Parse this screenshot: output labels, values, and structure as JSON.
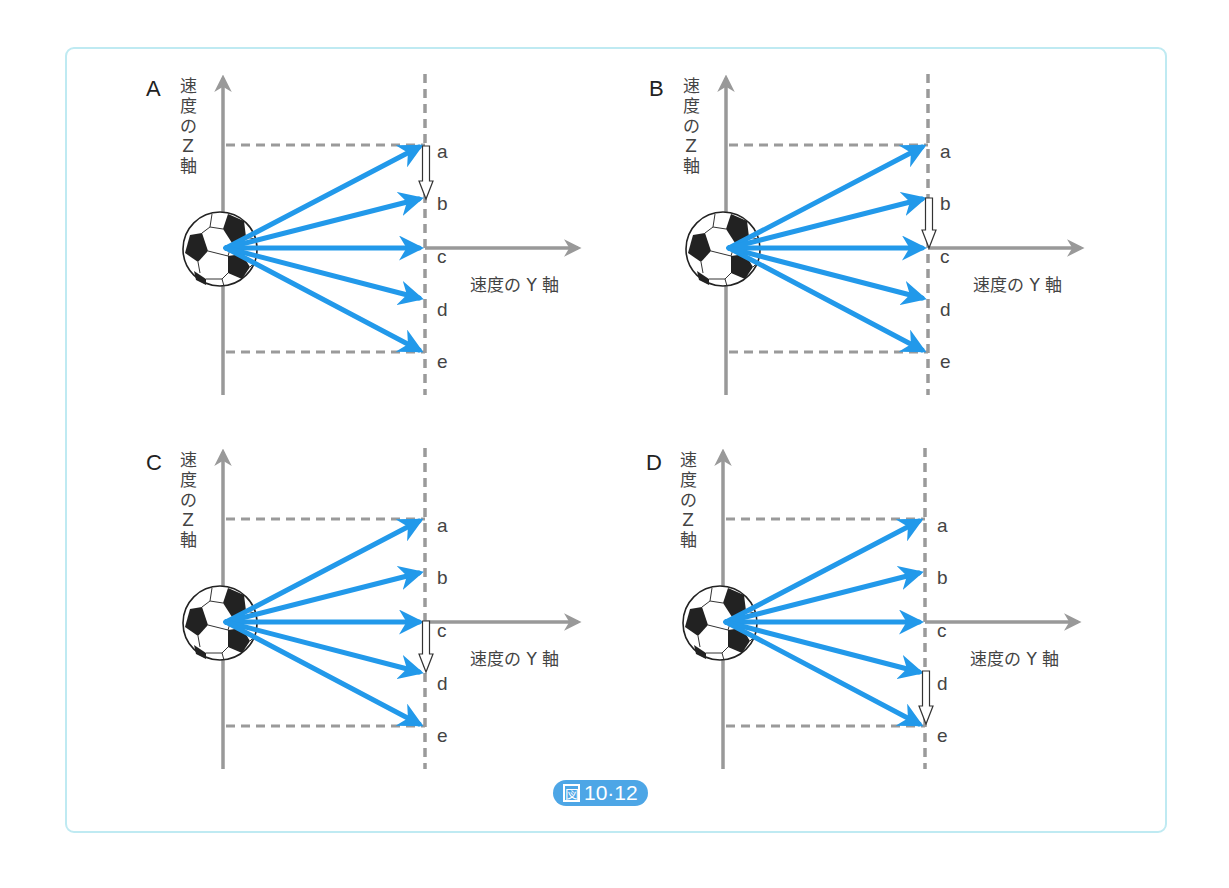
{
  "figure": {
    "caption_prefix": "図",
    "caption_number": "10·12",
    "z_axis_label_chars": [
      "速",
      "度",
      "の",
      "Z",
      "軸"
    ],
    "y_axis_label": "速度の Y 軸",
    "point_labels": [
      "a",
      "b",
      "c",
      "d",
      "e"
    ],
    "colors": {
      "velocity_arrow": "#2299ea",
      "axis": "#999999",
      "dashed_guide": "#9a9a9a",
      "frame_border": "#bfeaf2",
      "caption_badge": "#4da6e6"
    },
    "panels": [
      {
        "letter": "A",
        "change_arrow": {
          "from": "a",
          "to": "b"
        }
      },
      {
        "letter": "B",
        "change_arrow": {
          "from": "b",
          "to": "c"
        }
      },
      {
        "letter": "C",
        "change_arrow": {
          "from": "c",
          "to": "d"
        }
      },
      {
        "letter": "D",
        "change_arrow": {
          "from": "d",
          "to": "e"
        }
      }
    ],
    "velocity_arrows_per_panel": [
      "a",
      "b",
      "c",
      "d",
      "e"
    ],
    "icons": {
      "ball": "soccer-ball-icon",
      "change_arrow": "hollow-down-arrow-icon"
    }
  }
}
